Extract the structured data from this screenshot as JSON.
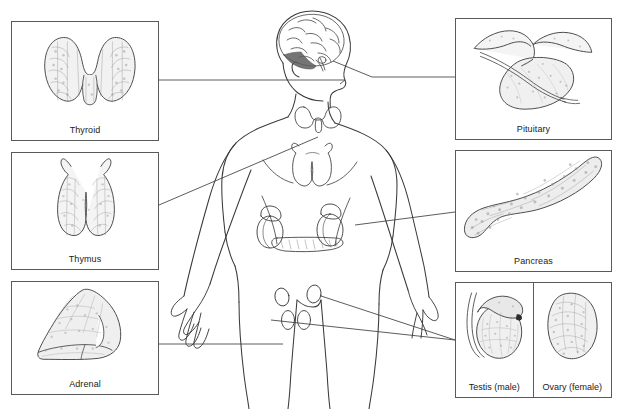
{
  "figure": {
    "background_color": "#ffffff",
    "line_color": "#3a3a3a",
    "box_border_color": "#5a5a5a",
    "label_color": "#1a1a1a"
  },
  "panels": {
    "left": [
      {
        "id": "thyroid",
        "label": "Thyroid",
        "sublabel": "",
        "x": 11,
        "y": 21,
        "w": 148,
        "h": 120
      },
      {
        "id": "thymus",
        "label": "Thymus",
        "sublabel": "",
        "x": 11,
        "y": 152,
        "w": 148,
        "h": 118
      },
      {
        "id": "adrenal",
        "label": "Adrenal",
        "sublabel": "",
        "x": 11,
        "y": 281,
        "w": 148,
        "h": 114
      }
    ],
    "right": [
      {
        "id": "pituitary",
        "label": "Pituitary",
        "sublabel": "",
        "x": 455,
        "y": 18,
        "w": 157,
        "h": 122
      },
      {
        "id": "pancreas",
        "label": "Pancreas",
        "sublabel": "",
        "x": 455,
        "y": 150,
        "w": 157,
        "h": 122
      },
      {
        "id": "gonads",
        "label": "",
        "sublabel": "",
        "x": 455,
        "y": 282,
        "w": 157,
        "h": 116
      }
    ],
    "gonads_split": [
      {
        "id": "testis",
        "label": "Testis",
        "sublabel": "(male)"
      },
      {
        "id": "ovary",
        "label": "Ovary",
        "sublabel": "(female)"
      }
    ]
  },
  "body_figure": {
    "organs": [
      {
        "name": "brain-pituitary",
        "label_target": "pituitary"
      },
      {
        "name": "thyroid-gland",
        "label_target": "thyroid"
      },
      {
        "name": "thymus-gland",
        "label_target": "thymus"
      },
      {
        "name": "adrenal-glands",
        "label_target": "adrenal"
      },
      {
        "name": "pancreas-gland",
        "label_target": "pancreas"
      },
      {
        "name": "ovaries",
        "label_target": "ovary"
      },
      {
        "name": "testes",
        "label_target": "testis"
      }
    ]
  },
  "icons": {
    "thyroid": "thyroid-gland-icon",
    "thymus": "thymus-gland-icon",
    "adrenal": "adrenal-gland-icon",
    "pituitary": "pituitary-gland-icon",
    "pancreas": "pancreas-gland-icon",
    "testis": "testis-icon",
    "ovary": "ovary-icon",
    "body": "human-body-outline-icon"
  }
}
